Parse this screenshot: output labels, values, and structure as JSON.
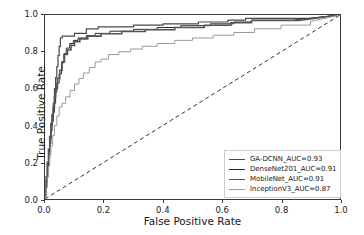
{
  "chart_data": {
    "type": "line",
    "title": "",
    "xlabel": "False Positive Rate",
    "ylabel": "True Positive Rate",
    "xlim": [
      0.0,
      1.0
    ],
    "ylim": [
      0.0,
      1.0
    ],
    "xticks": [
      "0.0",
      "0.2",
      "0.4",
      "0.6",
      "0.8",
      "1.0"
    ],
    "yticks": [
      "0.0",
      "0.2",
      "0.4",
      "0.6",
      "0.8",
      "1.0"
    ],
    "xtick_values": [
      0.0,
      0.2,
      0.4,
      0.6,
      0.8,
      1.0
    ],
    "ytick_values": [
      0.0,
      0.2,
      0.4,
      0.6,
      0.8,
      1.0
    ],
    "grid": false,
    "legend_position": "lower right",
    "chance_line": {
      "label": "chance-diagonal",
      "style": "dashed",
      "color": "#333333",
      "points": [
        [
          0.0,
          0.0
        ],
        [
          1.0,
          1.0
        ]
      ]
    },
    "series": [
      {
        "name": "GA-DCNN_AUC=0.93",
        "model": "GA-DCNN",
        "auc": 0.93,
        "color": "#4a4a4a",
        "width": 1.2,
        "points": [
          [
            0.0,
            0.0
          ],
          [
            0.0,
            0.04
          ],
          [
            0.004,
            0.04
          ],
          [
            0.004,
            0.1
          ],
          [
            0.008,
            0.1
          ],
          [
            0.008,
            0.19
          ],
          [
            0.012,
            0.19
          ],
          [
            0.012,
            0.26
          ],
          [
            0.016,
            0.26
          ],
          [
            0.016,
            0.33
          ],
          [
            0.02,
            0.33
          ],
          [
            0.02,
            0.4
          ],
          [
            0.024,
            0.4
          ],
          [
            0.024,
            0.45
          ],
          [
            0.028,
            0.45
          ],
          [
            0.028,
            0.52
          ],
          [
            0.032,
            0.52
          ],
          [
            0.032,
            0.6
          ],
          [
            0.036,
            0.6
          ],
          [
            0.036,
            0.66
          ],
          [
            0.04,
            0.66
          ],
          [
            0.04,
            0.72
          ],
          [
            0.044,
            0.72
          ],
          [
            0.044,
            0.78
          ],
          [
            0.048,
            0.78
          ],
          [
            0.048,
            0.83
          ],
          [
            0.052,
            0.83
          ],
          [
            0.052,
            0.875
          ],
          [
            0.058,
            0.875
          ],
          [
            0.058,
            0.885
          ],
          [
            0.1,
            0.885
          ],
          [
            0.1,
            0.9
          ],
          [
            0.14,
            0.9
          ],
          [
            0.14,
            0.925
          ],
          [
            0.18,
            0.925
          ],
          [
            0.18,
            0.935
          ],
          [
            0.3,
            0.935
          ],
          [
            0.3,
            0.945
          ],
          [
            0.4,
            0.945
          ],
          [
            0.4,
            0.952
          ],
          [
            0.52,
            0.952
          ],
          [
            0.52,
            0.962
          ],
          [
            0.62,
            0.962
          ],
          [
            0.62,
            0.972
          ],
          [
            0.68,
            0.972
          ],
          [
            0.68,
            0.982
          ],
          [
            0.9,
            0.982
          ],
          [
            1.0,
            1.0
          ]
        ]
      },
      {
        "name": "DenseNet201_AUC=0.91",
        "model": "DenseNet201",
        "auc": 0.91,
        "color": "#2b2b2b",
        "width": 1.0,
        "points": [
          [
            0.0,
            0.0
          ],
          [
            0.0,
            0.02
          ],
          [
            0.004,
            0.02
          ],
          [
            0.004,
            0.08
          ],
          [
            0.008,
            0.08
          ],
          [
            0.008,
            0.15
          ],
          [
            0.012,
            0.15
          ],
          [
            0.012,
            0.22
          ],
          [
            0.016,
            0.22
          ],
          [
            0.016,
            0.3
          ],
          [
            0.02,
            0.3
          ],
          [
            0.02,
            0.37
          ],
          [
            0.024,
            0.37
          ],
          [
            0.024,
            0.42
          ],
          [
            0.028,
            0.42
          ],
          [
            0.028,
            0.47
          ],
          [
            0.032,
            0.47
          ],
          [
            0.032,
            0.52
          ],
          [
            0.036,
            0.52
          ],
          [
            0.036,
            0.58
          ],
          [
            0.04,
            0.58
          ],
          [
            0.04,
            0.63
          ],
          [
            0.048,
            0.63
          ],
          [
            0.048,
            0.68
          ],
          [
            0.056,
            0.68
          ],
          [
            0.056,
            0.74
          ],
          [
            0.064,
            0.74
          ],
          [
            0.064,
            0.79
          ],
          [
            0.072,
            0.79
          ],
          [
            0.072,
            0.82
          ],
          [
            0.084,
            0.82
          ],
          [
            0.084,
            0.845
          ],
          [
            0.096,
            0.845
          ],
          [
            0.096,
            0.862
          ],
          [
            0.112,
            0.862
          ],
          [
            0.112,
            0.875
          ],
          [
            0.14,
            0.875
          ],
          [
            0.14,
            0.888
          ],
          [
            0.17,
            0.888
          ],
          [
            0.17,
            0.9
          ],
          [
            0.22,
            0.9
          ],
          [
            0.22,
            0.912
          ],
          [
            0.3,
            0.912
          ],
          [
            0.3,
            0.922
          ],
          [
            0.38,
            0.922
          ],
          [
            0.38,
            0.932
          ],
          [
            0.46,
            0.932
          ],
          [
            0.46,
            0.942
          ],
          [
            0.56,
            0.942
          ],
          [
            0.56,
            0.952
          ],
          [
            0.64,
            0.952
          ],
          [
            0.64,
            0.962
          ],
          [
            0.7,
            0.962
          ],
          [
            0.7,
            0.972
          ],
          [
            0.84,
            0.972
          ],
          [
            1.0,
            1.0
          ]
        ]
      },
      {
        "name": "MobileNet_AUC=0.91",
        "model": "MobileNet",
        "auc": 0.91,
        "color": "#555555",
        "width": 1.6,
        "points": [
          [
            0.0,
            0.0
          ],
          [
            0.0,
            0.05
          ],
          [
            0.004,
            0.05
          ],
          [
            0.004,
            0.12
          ],
          [
            0.008,
            0.12
          ],
          [
            0.008,
            0.2
          ],
          [
            0.012,
            0.2
          ],
          [
            0.012,
            0.27
          ],
          [
            0.016,
            0.27
          ],
          [
            0.016,
            0.34
          ],
          [
            0.02,
            0.34
          ],
          [
            0.02,
            0.41
          ],
          [
            0.024,
            0.41
          ],
          [
            0.024,
            0.46
          ],
          [
            0.028,
            0.46
          ],
          [
            0.028,
            0.5
          ],
          [
            0.032,
            0.5
          ],
          [
            0.032,
            0.555
          ],
          [
            0.036,
            0.555
          ],
          [
            0.036,
            0.6
          ],
          [
            0.042,
            0.6
          ],
          [
            0.042,
            0.655
          ],
          [
            0.05,
            0.655
          ],
          [
            0.05,
            0.7
          ],
          [
            0.058,
            0.7
          ],
          [
            0.058,
            0.745
          ],
          [
            0.066,
            0.745
          ],
          [
            0.066,
            0.785
          ],
          [
            0.076,
            0.785
          ],
          [
            0.076,
            0.81
          ],
          [
            0.088,
            0.81
          ],
          [
            0.088,
            0.835
          ],
          [
            0.1,
            0.835
          ],
          [
            0.1,
            0.855
          ],
          [
            0.118,
            0.855
          ],
          [
            0.118,
            0.87
          ],
          [
            0.145,
            0.87
          ],
          [
            0.145,
            0.885
          ],
          [
            0.19,
            0.885
          ],
          [
            0.19,
            0.898
          ],
          [
            0.26,
            0.898
          ],
          [
            0.26,
            0.91
          ],
          [
            0.34,
            0.91
          ],
          [
            0.34,
            0.92
          ],
          [
            0.44,
            0.92
          ],
          [
            0.44,
            0.932
          ],
          [
            0.54,
            0.932
          ],
          [
            0.54,
            0.944
          ],
          [
            0.63,
            0.944
          ],
          [
            0.63,
            0.958
          ],
          [
            0.7,
            0.958
          ],
          [
            0.7,
            0.97
          ],
          [
            0.86,
            0.97
          ],
          [
            1.0,
            1.0
          ]
        ]
      },
      {
        "name": "InceptionV3_AUC=0.87",
        "model": "InceptionV3",
        "auc": 0.87,
        "color": "#9a9a9a",
        "width": 1.0,
        "points": [
          [
            0.0,
            0.0
          ],
          [
            0.0,
            0.01
          ],
          [
            0.004,
            0.01
          ],
          [
            0.004,
            0.06
          ],
          [
            0.008,
            0.06
          ],
          [
            0.008,
            0.12
          ],
          [
            0.012,
            0.12
          ],
          [
            0.012,
            0.18
          ],
          [
            0.016,
            0.18
          ],
          [
            0.016,
            0.24
          ],
          [
            0.02,
            0.24
          ],
          [
            0.02,
            0.29
          ],
          [
            0.026,
            0.29
          ],
          [
            0.026,
            0.345
          ],
          [
            0.032,
            0.345
          ],
          [
            0.032,
            0.4
          ],
          [
            0.04,
            0.4
          ],
          [
            0.04,
            0.45
          ],
          [
            0.048,
            0.45
          ],
          [
            0.048,
            0.5
          ],
          [
            0.058,
            0.5
          ],
          [
            0.058,
            0.52
          ],
          [
            0.07,
            0.52
          ],
          [
            0.07,
            0.555
          ],
          [
            0.085,
            0.555
          ],
          [
            0.085,
            0.59
          ],
          [
            0.1,
            0.59
          ],
          [
            0.1,
            0.625
          ],
          [
            0.115,
            0.625
          ],
          [
            0.115,
            0.655
          ],
          [
            0.13,
            0.655
          ],
          [
            0.13,
            0.685
          ],
          [
            0.15,
            0.685
          ],
          [
            0.15,
            0.715
          ],
          [
            0.17,
            0.715
          ],
          [
            0.17,
            0.745
          ],
          [
            0.19,
            0.745
          ],
          [
            0.19,
            0.76
          ],
          [
            0.215,
            0.76
          ],
          [
            0.215,
            0.785
          ],
          [
            0.25,
            0.785
          ],
          [
            0.25,
            0.8
          ],
          [
            0.29,
            0.8
          ],
          [
            0.29,
            0.815
          ],
          [
            0.33,
            0.815
          ],
          [
            0.33,
            0.83
          ],
          [
            0.38,
            0.83
          ],
          [
            0.38,
            0.845
          ],
          [
            0.44,
            0.845
          ],
          [
            0.44,
            0.862
          ],
          [
            0.5,
            0.862
          ],
          [
            0.5,
            0.875
          ],
          [
            0.57,
            0.875
          ],
          [
            0.57,
            0.89
          ],
          [
            0.64,
            0.89
          ],
          [
            0.64,
            0.905
          ],
          [
            0.71,
            0.905
          ],
          [
            0.71,
            0.925
          ],
          [
            0.8,
            0.925
          ],
          [
            0.8,
            0.945
          ],
          [
            0.9,
            0.945
          ],
          [
            0.9,
            0.965
          ],
          [
            1.0,
            1.0
          ]
        ]
      }
    ]
  }
}
